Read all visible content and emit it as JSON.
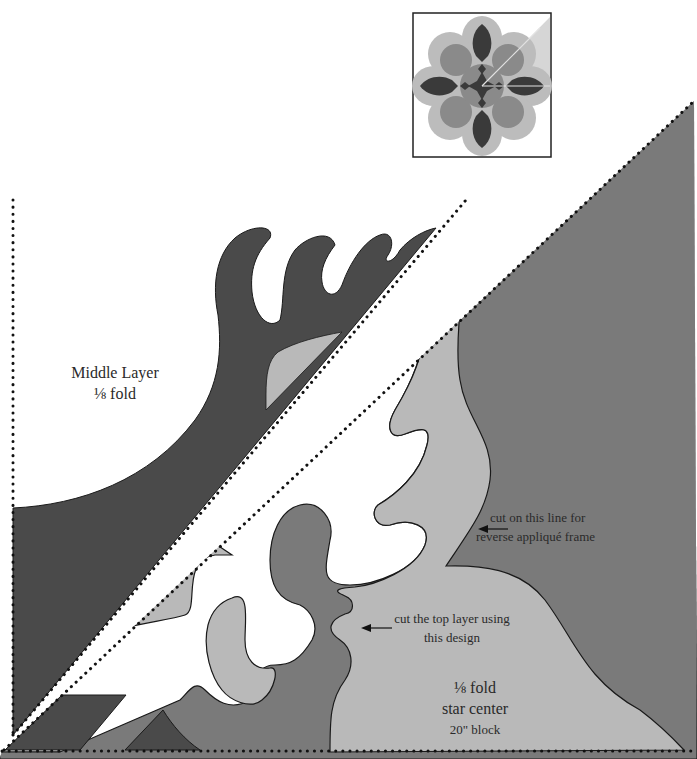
{
  "labels": {
    "middle_layer": {
      "line1": "Middle Layer",
      "line2": "⅛ fold"
    },
    "cut_frame": {
      "line1": "cut on this line for",
      "line2": "reverse appliqué frame"
    },
    "cut_top": {
      "line1": "cut the top layer using",
      "line2": "this design"
    },
    "fold_center": {
      "line1": "⅛ fold",
      "line2": "star center",
      "line3": "20\" block"
    }
  },
  "icons": {
    "arrow": "arrow-left-icon",
    "thumbnail": "star-block-thumbnail"
  },
  "colors": {
    "dark_layer": "#4a4a4a",
    "medium_layer": "#7a7a7a",
    "light_layer": "#b9b9b9",
    "outline": "#1a1a1a",
    "dots": "#111111",
    "background": "#ffffff"
  }
}
